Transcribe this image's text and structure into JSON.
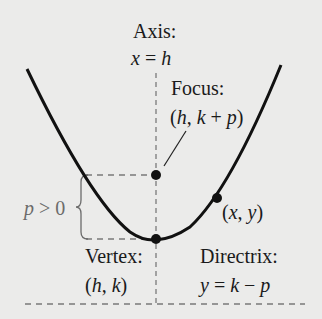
{
  "diagram": {
    "colors": {
      "background": "#ebebea",
      "curve": "#111111",
      "dashed": "#7a7a7a",
      "annotation_gray": "#6b6b6b"
    },
    "labels": {
      "axis_title": "Axis:",
      "axis_eq_var": "x",
      "axis_eq_op": " = ",
      "axis_eq_val": "h",
      "focus_title": "Focus:",
      "focus_coord_open": "(",
      "focus_coord_h": "h",
      "focus_coord_sep": ", ",
      "focus_coord_k": "k",
      "focus_coord_plus": " + ",
      "focus_coord_p": "p",
      "focus_coord_close": ")",
      "p_condition_var": "p",
      "p_condition_rest": " > 0",
      "point_open": "(",
      "point_x": "x",
      "point_sep": ", ",
      "point_y": "y",
      "point_close": ")",
      "vertex_title": "Vertex:",
      "vertex_open": "(",
      "vertex_h": "h",
      "vertex_sep": ", ",
      "vertex_k": "k",
      "vertex_close": ")",
      "directrix_title": "Directrix:",
      "directrix_var": "y",
      "directrix_op": " = ",
      "directrix_k": "k",
      "directrix_minus": " − ",
      "directrix_p": "p"
    },
    "points": {
      "focus": {
        "label": "Focus",
        "cx": 156,
        "cy": 175
      },
      "vertex": {
        "label": "Vertex",
        "cx": 156,
        "cy": 239
      },
      "general_point": {
        "label": "(x, y)",
        "cx": 217,
        "cy": 198
      }
    }
  }
}
